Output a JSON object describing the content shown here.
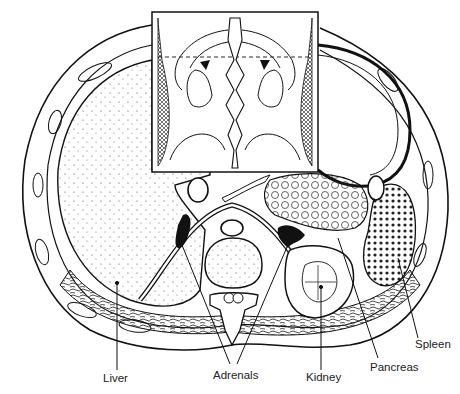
{
  "figure": {
    "labels": {
      "liver": "Liver",
      "adrenals": "Adrenals",
      "kidney": "Kidney",
      "pancreas": "Pancreas",
      "spleen": "Spleen"
    },
    "colors": {
      "ink": "#111111",
      "paper": "#ffffff",
      "hatch": "#555555"
    }
  }
}
